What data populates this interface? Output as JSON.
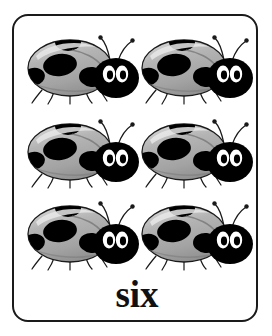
{
  "card": {
    "type": "counting-flashcard",
    "border_color": "#1a1a1a",
    "background_color": "#ffffff",
    "word": "six",
    "count": 6,
    "rows": 3,
    "columns": 2
  },
  "illustration": {
    "subject": "ladybug",
    "icon_name": "ladybug-icon",
    "body_color": "#a8a8a8",
    "body_highlight_color": "#d0d0d0",
    "body_shadow_color": "#8e8e8e",
    "spot_color": "#000000",
    "head_color": "#000000",
    "eye_color": "#ffffff",
    "pupil_color": "#000000",
    "outline_color": "#1a1a1a"
  },
  "bugs": [
    {
      "id": 1,
      "row": 0,
      "column": 0,
      "label": "ladybug-1"
    },
    {
      "id": 2,
      "row": 0,
      "column": 1,
      "label": "ladybug-2"
    },
    {
      "id": 3,
      "row": 1,
      "column": 0,
      "label": "ladybug-3"
    },
    {
      "id": 4,
      "row": 1,
      "column": 1,
      "label": "ladybug-4"
    },
    {
      "id": 5,
      "row": 2,
      "column": 0,
      "label": "ladybug-5"
    },
    {
      "id": 6,
      "row": 2,
      "column": 1,
      "label": "ladybug-6"
    }
  ]
}
